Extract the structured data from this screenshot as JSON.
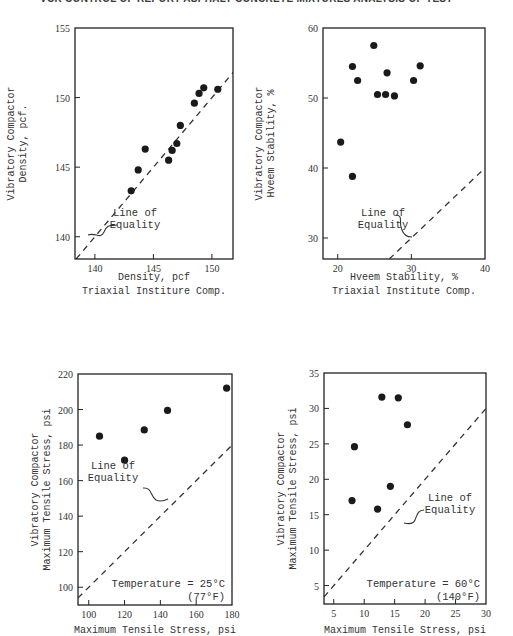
{
  "page": {
    "header_text": "VCR CONTROL OF REPORT ASPHALT CONCRETE MIXTURES ANALYSIS OF TEST"
  },
  "chart_data": [
    {
      "id": "density",
      "type": "scatter",
      "title": "",
      "xlabel": "Density, pcf",
      "xlabel2": "Triaxial Institure Comp.",
      "ylabel": "Vibratory Compactor",
      "ylabel2": "Density, pcf.",
      "xlim": [
        138.3,
        151.8
      ],
      "ylim": [
        138.4,
        155
      ],
      "xticks": [
        140,
        145,
        150
      ],
      "yticks": [
        140,
        145,
        150,
        155
      ],
      "grid": false,
      "reference_line": {
        "label": [
          "Line of",
          "Equality"
        ],
        "equation": "y = x"
      },
      "x": [
        143.1,
        143.7,
        144.3,
        146.3,
        146.6,
        147.0,
        147.3,
        148.5,
        148.9,
        149.3,
        150.5
      ],
      "y": [
        143.3,
        144.8,
        146.3,
        145.5,
        146.2,
        146.7,
        148.0,
        149.6,
        150.3,
        150.7,
        150.6
      ]
    },
    {
      "id": "hveem",
      "type": "scatter",
      "title": "",
      "xlabel": "Hveem Stability, %",
      "xlabel2": "Triaxial Institute Comp.",
      "ylabel": "Vibratory Compactor",
      "ylabel2": "Hveem Stability, %",
      "xlim": [
        18,
        40
      ],
      "ylim": [
        27,
        60
      ],
      "xticks": [
        20,
        30,
        40
      ],
      "yticks": [
        30,
        40,
        50,
        60
      ],
      "grid": false,
      "reference_line": {
        "label": [
          "Line of",
          "Equality"
        ],
        "equation": "y = x"
      },
      "x": [
        24.9,
        22.0,
        31.2,
        26.7,
        22.7,
        30.3,
        25.4,
        26.5,
        27.7,
        20.4,
        22.0
      ],
      "y": [
        57.5,
        54.5,
        54.6,
        53.6,
        52.5,
        52.5,
        50.5,
        50.5,
        50.3,
        43.7,
        38.8
      ]
    },
    {
      "id": "tensile_25c",
      "type": "scatter",
      "title": "",
      "xlabel": "Maximum Tensile Stress, psi",
      "xlabel2": "",
      "ylabel": "Vibratory Compactor",
      "ylabel2": "Maximum Tensile Stress, psi",
      "xlim": [
        94,
        180
      ],
      "ylim": [
        90,
        220
      ],
      "xticks": [
        100,
        120,
        140,
        160,
        180
      ],
      "yticks": [
        100,
        120,
        140,
        160,
        180,
        200,
        220
      ],
      "grid": false,
      "reference_line": {
        "label": [
          "Line of",
          "Equality"
        ],
        "equation": "y = x"
      },
      "annotation": [
        "Temperature = 25°C",
        "(77°F)"
      ],
      "x": [
        106,
        120,
        131,
        144,
        177
      ],
      "y": [
        185,
        171.5,
        188.5,
        199.5,
        212
      ]
    },
    {
      "id": "tensile_60c",
      "type": "scatter",
      "title": "",
      "xlabel": "Maximum Tensile Stress, psi",
      "xlabel2": "",
      "ylabel": "Vibratory Compactor",
      "ylabel2": "Maximum Tensile Stress, psi",
      "xlim": [
        3.4,
        30
      ],
      "ylim": [
        2.4,
        35
      ],
      "xticks": [
        5,
        10,
        15,
        20,
        25,
        30
      ],
      "yticks": [
        5,
        10,
        15,
        20,
        25,
        30,
        35
      ],
      "grid": false,
      "reference_line": {
        "label": [
          "Line of",
          "Equality"
        ],
        "equation": "y = x"
      },
      "annotation": [
        "Temperature = 60°C",
        "(140°F)"
      ],
      "x": [
        12.9,
        15.6,
        17.1,
        8.4,
        14.3,
        8.0,
        12.2
      ],
      "y": [
        31.6,
        31.5,
        27.7,
        24.6,
        19.0,
        17.0,
        15.8
      ]
    }
  ],
  "layout": [
    {
      "frame": [
        75,
        28,
        233,
        259
      ],
      "ylabel_x": [
        14,
        26
      ],
      "xlabel_y": [
        280,
        294
      ],
      "eq_label": [
        135,
        228
      ],
      "eq_brace": "M88,235 C96,232 100,240 104,232 C107,224 110,226 117,225",
      "brace_target": [
        88,
        235
      ]
    },
    {
      "frame": [
        323,
        28,
        485,
        259
      ],
      "ylabel_x": [
        262,
        274
      ],
      "xlabel_y": [
        280,
        294
      ],
      "eq_label": [
        383,
        228
      ],
      "eq_brace": "M396,215 C404,216 398,222 402,230 C404,236 408,237 412,237",
      "brace_target": [
        412,
        237
      ]
    },
    {
      "frame": [
        78,
        374,
        232,
        605
      ],
      "ylabel_x": [
        38,
        50
      ],
      "xlabel_y": [
        633,
        0
      ],
      "eq_label": [
        113,
        481
      ],
      "eq_brace": "M143,488 C152,487 150,496 156,500 C160,502 164,501 168,499",
      "annot_x": 225,
      "annot_y": [
        587,
        600
      ]
    },
    {
      "frame": [
        324,
        373,
        486,
        604
      ],
      "ylabel_x": [
        284,
        296
      ],
      "xlabel_y": [
        633,
        0
      ],
      "eq_label": [
        450,
        513
      ],
      "eq_brace": "M424,510 C418,510 417,515 415,520 C413,525 408,524 404,523",
      "annot_x": 480,
      "annot_y": [
        587,
        600
      ]
    }
  ]
}
